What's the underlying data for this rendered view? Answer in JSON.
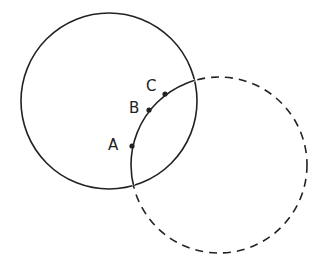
{
  "diagram": {
    "stroke_color": "#222222",
    "background": "#ffffff",
    "circle_1": {
      "style": "solid",
      "cx": 109,
      "cy": 101,
      "r": 88
    },
    "circle_2": {
      "style": "dashed outside circle 1, solid inside",
      "cx": 219,
      "cy": 165,
      "r": 88
    },
    "points": [
      {
        "label": "A",
        "x": 132,
        "y": 146,
        "label_x": 108,
        "label_y": 150
      },
      {
        "label": "B",
        "x": 149,
        "y": 110,
        "label_x": 129,
        "label_y": 113
      },
      {
        "label": "C",
        "x": 165,
        "y": 94,
        "label_x": 146,
        "label_y": 91
      }
    ]
  }
}
